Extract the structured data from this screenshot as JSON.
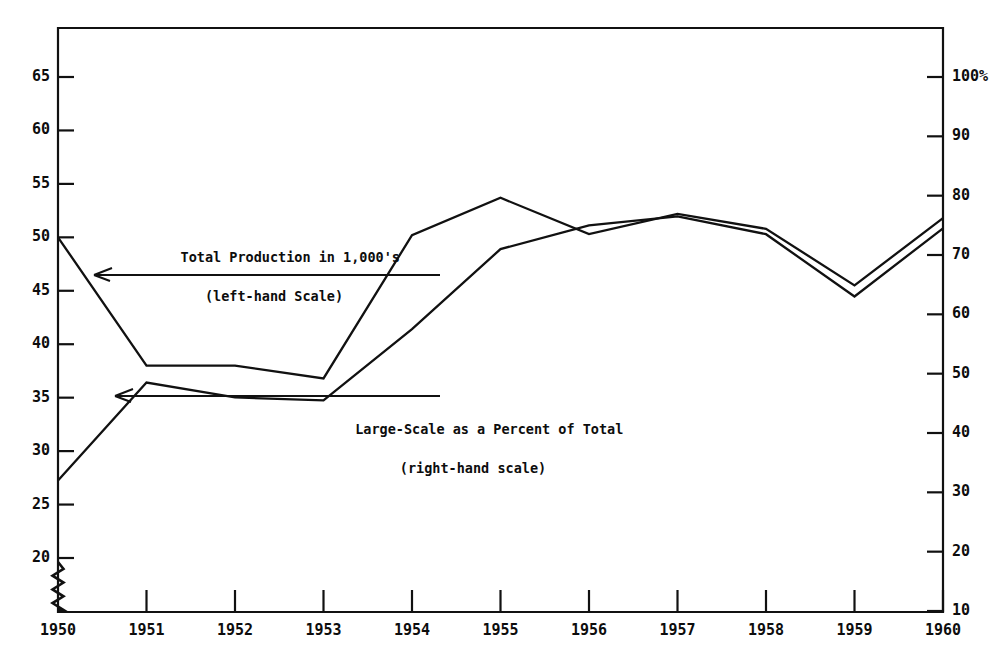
{
  "chart_data": {
    "type": "line",
    "title": "",
    "subtitle": "",
    "xlabel": "",
    "ylabel": "",
    "grid": false,
    "legend_position": "inline-annotations",
    "x": [
      1950,
      1951,
      1952,
      1953,
      1954,
      1955,
      1956,
      1957,
      1958,
      1959,
      1960
    ],
    "categories": [
      "1950",
      "1951",
      "1952",
      "1953",
      "1954",
      "1955",
      "1956",
      "1957",
      "1958",
      "1959",
      "1960"
    ],
    "axes": {
      "x": {
        "ticks": [
          "1950",
          "1951",
          "1952",
          "1953",
          "1954",
          "1955",
          "1956",
          "1957",
          "1958",
          "1959",
          "1960"
        ],
        "range": [
          1950,
          1960
        ]
      },
      "y_left": {
        "label": "Total Production in 1,000's",
        "ticks": [
          "20",
          "25",
          "30",
          "35",
          "40",
          "45",
          "50",
          "55",
          "60",
          "65"
        ],
        "tick_values": [
          20,
          25,
          30,
          35,
          40,
          45,
          50,
          55,
          60,
          65
        ],
        "range": [
          20,
          65
        ],
        "axis_break": true,
        "break_note": "zigzag break below 20"
      },
      "y_right": {
        "label": "Large-Scale as a Percent of Total",
        "ticks": [
          "10",
          "20",
          "30",
          "40",
          "50",
          "60",
          "70",
          "80",
          "90",
          "100%"
        ],
        "tick_values": [
          10,
          20,
          30,
          40,
          50,
          60,
          70,
          80,
          90,
          100
        ],
        "range": [
          0,
          100
        ],
        "unit": "%"
      }
    },
    "series": [
      {
        "name": "Total Production in 1,000's",
        "axis": "left",
        "values": [
          50.0,
          38.0,
          38.0,
          36.8,
          50.2,
          53.7,
          50.3,
          52.2,
          50.8,
          45.5,
          51.8
        ]
      },
      {
        "name": "Large-Scale as a Percent of Total",
        "axis": "right",
        "values": [
          32.0,
          48.5,
          46.0,
          45.5,
          57.5,
          71.0,
          75.0,
          76.5,
          73.5,
          63.0,
          74.5
        ]
      }
    ],
    "annotations": [
      {
        "id": "annotation-total-production",
        "line1": "Total Production in 1,000's",
        "line2": "(left-hand Scale)",
        "points_to": "left-series"
      },
      {
        "id": "annotation-large-scale-percent",
        "line1": "Large-Scale as a Percent of Total",
        "line2": "(right-hand scale)",
        "points_to": "right-series"
      }
    ],
    "colors": {
      "line": "#111111",
      "axis": "#111111",
      "background": "#ffffff"
    }
  }
}
